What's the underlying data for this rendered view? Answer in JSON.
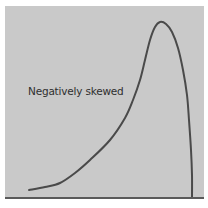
{
  "chart_data": {
    "type": "line",
    "title": "",
    "annotation": "Negatively skewed",
    "xlabel": "",
    "ylabel": "",
    "grid": false,
    "legend": null,
    "points_px": [
      [
        29,
        190
      ],
      [
        45,
        187
      ],
      [
        60,
        183
      ],
      [
        75,
        173
      ],
      [
        90,
        160
      ],
      [
        110,
        140
      ],
      [
        125,
        118
      ],
      [
        133,
        100
      ],
      [
        140,
        80
      ],
      [
        145,
        60
      ],
      [
        150,
        40
      ],
      [
        155,
        27
      ],
      [
        160,
        22
      ],
      [
        166,
        24
      ],
      [
        172,
        32
      ],
      [
        178,
        48
      ],
      [
        183,
        70
      ],
      [
        187,
        95
      ],
      [
        189,
        120
      ],
      [
        191,
        150
      ],
      [
        192,
        175
      ],
      [
        192,
        198
      ]
    ],
    "colors": {
      "background": "#c9c9c9",
      "curve": "#4a4a4a",
      "text": "#2f2f2f"
    }
  },
  "annotation_text": "Negatively skewed"
}
